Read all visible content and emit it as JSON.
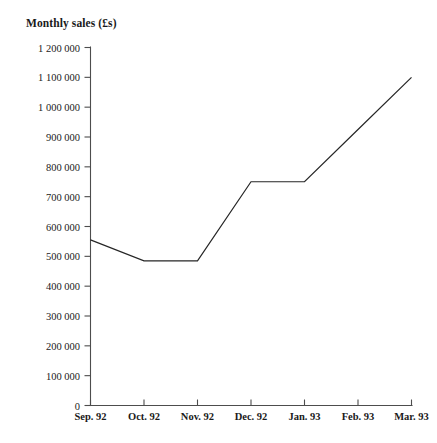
{
  "chart_data": {
    "type": "line",
    "title": "Monthly sales (£s)",
    "xlabel": "",
    "ylabel": "",
    "categories": [
      "Sep. 92",
      "Oct. 92",
      "Nov. 92",
      "Dec. 92",
      "Jan. 93",
      "Feb. 93",
      "Mar. 93"
    ],
    "values": [
      555000,
      485000,
      485000,
      750000,
      750000,
      925000,
      1100000
    ],
    "ylim": [
      0,
      1200000
    ],
    "ytick_values": [
      0,
      100000,
      200000,
      300000,
      400000,
      500000,
      600000,
      700000,
      800000,
      900000,
      1000000,
      1100000,
      1200000
    ],
    "ytick_labels": [
      "0",
      "100 000",
      "200 000",
      "300 000",
      "400 000",
      "500 000",
      "600 000",
      "700 000",
      "800 000",
      "900 000",
      "1 000 000",
      "1 100 000",
      "1 200 000"
    ],
    "grid": false,
    "legend": false,
    "line_color": "#262626",
    "axis_color": "#4d4d4d"
  }
}
